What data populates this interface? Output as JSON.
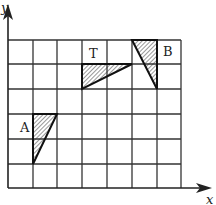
{
  "diagram": {
    "type": "coordinate-grid",
    "columns": 7,
    "rows": 6,
    "axes": {
      "x_label": "x",
      "y_label": "y"
    },
    "shapes": [
      {
        "label": "A",
        "kind": "right-triangle",
        "cells": [
          [
            1,
            0
          ],
          [
            2,
            0
          ],
          [
            1,
            2
          ]
        ]
      },
      {
        "label": "T",
        "kind": "right-triangle",
        "cells": [
          [
            3,
            5
          ],
          [
            5,
            5
          ],
          [
            3,
            4
          ]
        ]
      },
      {
        "label": "B",
        "kind": "right-triangle",
        "cells": [
          [
            5,
            6
          ],
          [
            6,
            6
          ],
          [
            6,
            4
          ]
        ]
      }
    ],
    "colors": {
      "line": "#222222",
      "background": "#ffffff"
    }
  }
}
